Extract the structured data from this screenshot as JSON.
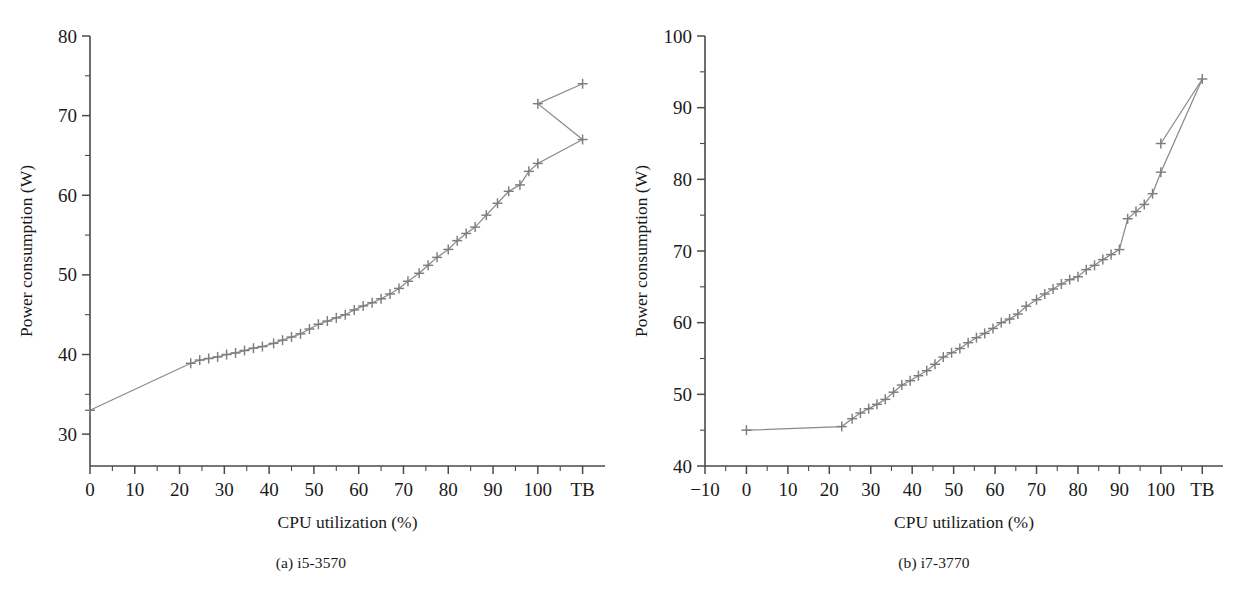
{
  "figure": {
    "panels": [
      {
        "id": "a",
        "caption": "(a) i5-3570",
        "xlabel": "CPU utilization (%)",
        "ylabel": "Power consumption (W)"
      },
      {
        "id": "b",
        "caption": "(b) i7-3770",
        "xlabel": "CPU utilization (%)",
        "ylabel": "Power consumption (W)"
      }
    ]
  },
  "chart_data": [
    {
      "type": "line",
      "title": "(a) i5-3570",
      "xlabel": "CPU utilization (%)",
      "ylabel": "Power consumption (W)",
      "xlim": [
        0,
        115
      ],
      "ylim": [
        26,
        80
      ],
      "grid": false,
      "legend": null,
      "marker": "plus",
      "marker_color": "#7d7d7d",
      "line_color": "#8a8a8a",
      "xticks": [
        0,
        10,
        20,
        30,
        40,
        50,
        60,
        70,
        80,
        90,
        100,
        110
      ],
      "xticklabels": [
        "0",
        "10",
        "20",
        "30",
        "40",
        "50",
        "60",
        "70",
        "80",
        "90",
        "100",
        "TB"
      ],
      "yticks": [
        30,
        40,
        50,
        60,
        70,
        80
      ],
      "yticklabels": [
        "30",
        "40",
        "50",
        "60",
        "70",
        "80"
      ],
      "yminor": [
        35,
        45,
        55,
        65,
        75
      ],
      "x": [
        0,
        22.5,
        24.5,
        26.5,
        28.5,
        30.5,
        32.5,
        34.5,
        36.5,
        38.5,
        41,
        43,
        45,
        47,
        49,
        51,
        53,
        55,
        57,
        59,
        61,
        63,
        65,
        67,
        69,
        71,
        73.5,
        75.5,
        77.5,
        80,
        82,
        84,
        86,
        88.5,
        91,
        93.5,
        96,
        98,
        100,
        110
      ],
      "y": [
        33.0,
        38.9,
        39.3,
        39.5,
        39.7,
        40.0,
        40.2,
        40.5,
        40.8,
        41.0,
        41.4,
        41.8,
        42.2,
        42.6,
        43.2,
        43.8,
        44.2,
        44.6,
        45.0,
        45.6,
        46.1,
        46.5,
        47.0,
        47.6,
        48.3,
        49.2,
        50.2,
        51.2,
        52.2,
        53.2,
        54.3,
        55.2,
        56.0,
        57.5,
        59.0,
        60.5,
        61.3,
        63.0,
        64.0,
        67.0
      ],
      "x_extra": [
        100,
        110
      ],
      "y_extra": [
        71.5,
        74.0
      ],
      "annotations": [
        {
          "text": "TB denotes turbo boost operating point at the right end of the x-axis"
        }
      ]
    },
    {
      "type": "line",
      "title": "(b) i7-3770",
      "xlabel": "CPU utilization (%)",
      "ylabel": "Power consumption (W)",
      "xlim": [
        -10,
        115
      ],
      "ylim": [
        40,
        100
      ],
      "grid": false,
      "legend": null,
      "marker": "plus",
      "marker_color": "#7d7d7d",
      "line_color": "#8a8a8a",
      "xticks": [
        -10,
        0,
        10,
        20,
        30,
        40,
        50,
        60,
        70,
        80,
        90,
        100,
        110
      ],
      "xticklabels": [
        "−10",
        "0",
        "10",
        "20",
        "30",
        "40",
        "50",
        "60",
        "70",
        "80",
        "90",
        "100",
        "TB"
      ],
      "yticks": [
        40,
        50,
        60,
        70,
        80,
        90,
        100
      ],
      "yticklabels": [
        "40",
        "50",
        "60",
        "70",
        "80",
        "90",
        "100"
      ],
      "yminor": [
        45,
        55,
        65,
        75,
        85,
        95
      ],
      "x": [
        0,
        23,
        25.5,
        27.5,
        29.5,
        31.5,
        33.5,
        35.5,
        37.5,
        39.5,
        41.5,
        43.5,
        45.5,
        47.5,
        49.5,
        51.5,
        53.5,
        55.5,
        57.5,
        59.5,
        61.5,
        63.5,
        65.5,
        67.5,
        70,
        72,
        74,
        76,
        78,
        80,
        82,
        84,
        86,
        88,
        90,
        92,
        94,
        96,
        98,
        100,
        110
      ],
      "y": [
        45.0,
        45.5,
        46.6,
        47.4,
        48.0,
        48.6,
        49.3,
        50.3,
        51.3,
        51.9,
        52.6,
        53.3,
        54.2,
        55.2,
        55.8,
        56.4,
        57.2,
        57.9,
        58.5,
        59.2,
        60.0,
        60.5,
        61.2,
        62.3,
        63.2,
        64.0,
        64.7,
        65.4,
        66.0,
        66.4,
        67.4,
        68.0,
        68.8,
        69.5,
        70.2,
        74.5,
        75.5,
        76.5,
        78.0,
        81.0,
        94.0
      ],
      "x_extra": [
        100
      ],
      "y_extra": [
        85.0
      ],
      "annotations": [
        {
          "text": "TB denotes turbo boost operating point at the right end of the x-axis"
        }
      ]
    }
  ]
}
